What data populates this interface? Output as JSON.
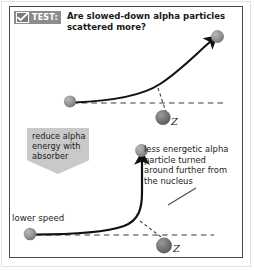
{
  "figure": {
    "header": {
      "badge_label": "TEST:",
      "badge_icon": "checkmark-icon",
      "question": "Are slowed-down alpha particles scattered more?"
    },
    "callouts": {
      "absorber": "reduce alpha energy with absorber",
      "annotation": "less energetic alpha particle turned around further from the nucleus",
      "lower_speed": "lower speed"
    },
    "nucleus": {
      "top_label": "Z",
      "bottom_label": "Z"
    },
    "colors": {
      "badge_background": "#8c8c8c",
      "callout_background": "#c9c9c9",
      "frame": "#4a4a4a",
      "outer_frame": "#e2e2e2",
      "particle_fill": "#8e8e8e",
      "nucleus_fill": "#6e6e6e",
      "trajectory": "#111111",
      "dashed_line": "#3a3a3a",
      "page_background": "#ffffff"
    }
  }
}
